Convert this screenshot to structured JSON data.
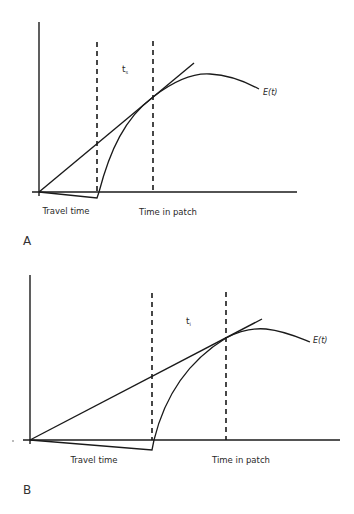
{
  "figure": {
    "panels": [
      {
        "id": "A",
        "panel_label": "A",
        "curve_label": "E(t)",
        "tangent_time_label": "t",
        "tangent_time_subscript": "s",
        "x_labels": {
          "travel": "Travel time",
          "patch": "Time in patch"
        }
      },
      {
        "id": "B",
        "panel_label": "B",
        "curve_label": "E(t)",
        "tangent_time_label": "t",
        "tangent_time_subscript": "i",
        "x_labels": {
          "travel": "Travel time",
          "patch": "Time in patch"
        }
      }
    ],
    "colors": {
      "line": "#1a1a1a",
      "background": "#ffffff"
    }
  }
}
